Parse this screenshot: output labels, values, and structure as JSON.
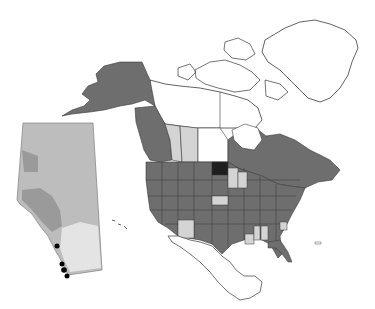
{
  "map": {
    "title": "North America distribution map with Alberta inset",
    "colors": {
      "background": "#ffffff",
      "outline": "#3a3a3a",
      "present": "#6e6e6e",
      "absent": "#ffffff",
      "uncertain": "#d4d4d4",
      "highlight": "#1e1e1e",
      "inset_base": "#bdbdbd",
      "inset_dark": "#9a9a9a",
      "inset_light": "#e4e4e4",
      "occurrence_points": "#000000"
    },
    "legend": [],
    "regions": {
      "alaska": "present",
      "yukon": "absent",
      "northwest_territories": "absent",
      "nunavut": "absent",
      "british_columbia": "present",
      "alberta": "uncertain",
      "saskatchewan": "uncertain",
      "manitoba": "absent",
      "ontario": "present",
      "quebec": "present",
      "atlantic_canada": "present",
      "greenland": "absent",
      "north_dakota": "highlight",
      "nebraska": "uncertain",
      "minnesota": "uncertain",
      "wisconsin": "uncertain",
      "arizona": "uncertain",
      "louisiana": "uncertain",
      "mississippi": "uncertain",
      "alabama": "uncertain",
      "south_carolina": "uncertain",
      "other_us_states": "present",
      "mexico": "absent"
    },
    "inset": {
      "region": "Alberta",
      "points": [
        {
          "x": 57,
          "y": 246
        },
        {
          "x": 62,
          "y": 264
        },
        {
          "x": 64,
          "y": 270
        },
        {
          "x": 67,
          "y": 276
        }
      ]
    }
  }
}
